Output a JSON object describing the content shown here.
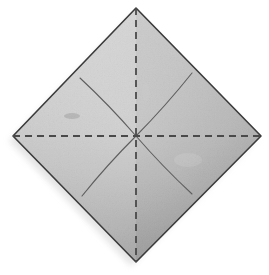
{
  "figure": {
    "title": "Origami square preliminary crease pattern",
    "canvas": {
      "width": 269,
      "height": 275
    },
    "background_color": "#ffffff"
  },
  "paper": {
    "name": "square-sheet",
    "orientation_degrees": 45,
    "vertices": {
      "top": {
        "x": 136,
        "y": 8
      },
      "right": {
        "x": 261,
        "y": 136
      },
      "bottom": {
        "x": 136,
        "y": 262
      },
      "left": {
        "x": 13,
        "y": 136
      }
    },
    "center": {
      "x": 136,
      "y": 136
    },
    "fill_color_light": "#cfcfcf",
    "fill_color_mid": "#bdbdbd",
    "fill_color_dark": "#a9a9a9",
    "outline_color": "#3b3b3b",
    "outline_width": 1.6,
    "shadow_color": "#e6e6e6"
  },
  "creases": {
    "fold_lines": [
      {
        "name": "vertical-fold-line",
        "style": "dashed",
        "color": "#4a4a4a",
        "width": 1.8,
        "dash": "7 5",
        "x1": 136,
        "y1": 8,
        "x2": 136,
        "y2": 262
      },
      {
        "name": "horizontal-fold-line",
        "style": "dashed",
        "color": "#4a4a4a",
        "width": 1.8,
        "dash": "7 5",
        "x1": 13,
        "y1": 136,
        "x2": 261,
        "y2": 136
      }
    ],
    "existing_creases": [
      {
        "name": "crease-upper-left",
        "style": "solid",
        "color": "#5e5e5e",
        "width": 1.1,
        "x1": 136,
        "y1": 136,
        "x2": 80,
        "y2": 78
      },
      {
        "name": "crease-upper-right",
        "style": "solid",
        "color": "#5e5e5e",
        "width": 1.1,
        "x1": 136,
        "y1": 136,
        "x2": 192,
        "y2": 73
      },
      {
        "name": "crease-lower-left",
        "style": "solid",
        "color": "#5e5e5e",
        "width": 1.1,
        "x1": 136,
        "y1": 136,
        "x2": 82,
        "y2": 196
      },
      {
        "name": "crease-lower-right",
        "style": "solid",
        "color": "#5e5e5e",
        "width": 1.1,
        "x1": 136,
        "y1": 136,
        "x2": 192,
        "y2": 194
      }
    ]
  },
  "blemishes": [
    {
      "name": "paper-smudge",
      "x": 72,
      "y": 116,
      "rx": 8,
      "ry": 3,
      "color": "#9a9a9a",
      "opacity": 0.45
    },
    {
      "name": "paper-crease-mark",
      "x": 146,
      "y": 92,
      "rx": 4,
      "ry": 10,
      "color": "#c9c9c9",
      "opacity": 0.5
    }
  ]
}
